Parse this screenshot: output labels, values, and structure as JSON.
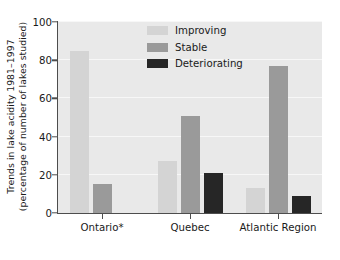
{
  "chart_data": {
    "type": "bar",
    "title": "",
    "subtitle": "",
    "xlabel": "",
    "ylabel": "Trends in lake acidity 1981–1997 (percentage of number of lakes studied)",
    "ylabel_line1": "Trends in lake acidity 1981–1997",
    "ylabel_line2": "(percentage of number of lakes studied)",
    "categories": [
      "Ontario*",
      "Quebec",
      "Atlantic Region"
    ],
    "series": [
      {
        "name": "Improving",
        "values": [
          85,
          27,
          13
        ],
        "color": "#d4d4d4"
      },
      {
        "name": "Stable",
        "values": [
          15,
          51,
          77
        ],
        "color": "#9a9a9a"
      },
      {
        "name": "Deteriorating",
        "values": [
          0,
          21,
          9
        ],
        "color": "#262626"
      }
    ],
    "ylim": [
      0,
      100
    ],
    "yticks": [
      0,
      20,
      40,
      60,
      80,
      100
    ],
    "ytick_labels": [
      "0",
      "20",
      "40",
      "60",
      "80",
      "100"
    ],
    "grid": true,
    "grid_axis": "y",
    "grid_color": "#f7f7f7",
    "plot_background": "#e9e9e9",
    "figure_background": "#ffffff",
    "axis_color": "#4d4d4d",
    "legend_position": "upper center",
    "legend_entries": [
      "Improving",
      "Stable",
      "Deteriorating"
    ],
    "footnote_marker": "*"
  }
}
